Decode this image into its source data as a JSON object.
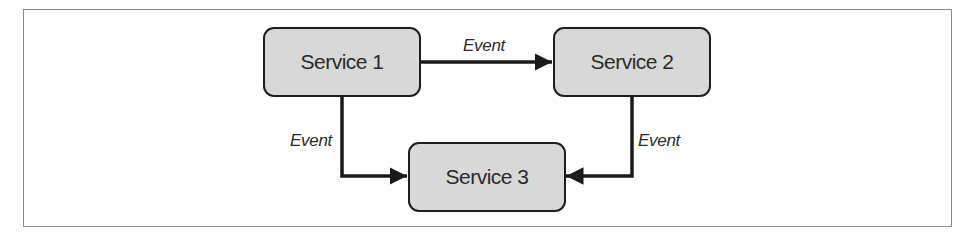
{
  "diagram": {
    "nodes": [
      {
        "id": "service1",
        "label": "Service 1"
      },
      {
        "id": "service2",
        "label": "Service 2"
      },
      {
        "id": "service3",
        "label": "Service 3"
      }
    ],
    "edges": [
      {
        "from": "service1",
        "to": "service2",
        "label": "Event"
      },
      {
        "from": "service1",
        "to": "service3",
        "label": "Event"
      },
      {
        "from": "service2",
        "to": "service3",
        "label": "Event"
      }
    ],
    "colors": {
      "node_fill": "#d8d8d8",
      "node_border": "#1e1e1e",
      "edge": "#1a1a1a",
      "frame": "#8a8a8a"
    }
  }
}
